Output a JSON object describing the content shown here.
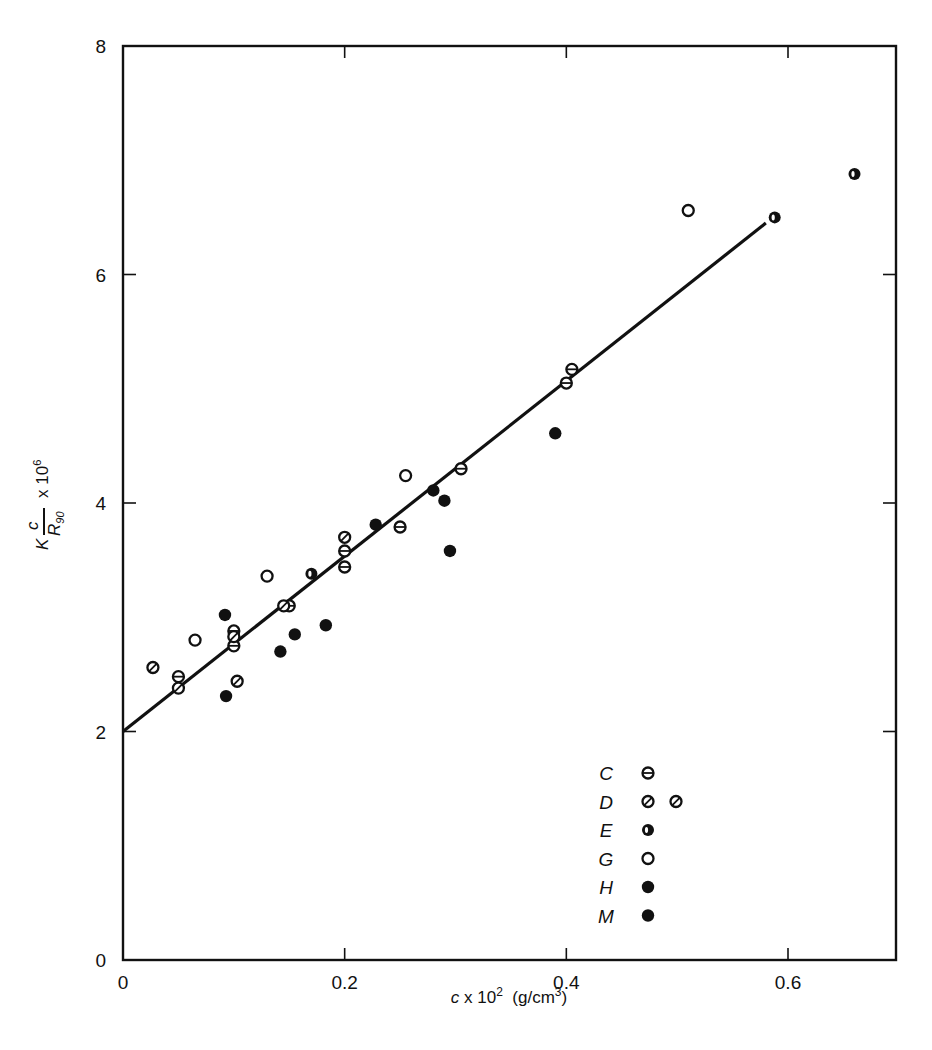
{
  "chart_data": {
    "type": "scatter",
    "title": "",
    "xlabel": "c x 10^2 (g/cm^3)",
    "ylabel": "K c/R90 x 10^6",
    "xlim": [
      0,
      0.7
    ],
    "ylim": [
      0,
      8
    ],
    "grid": false,
    "legend_position": "lower right (inside)",
    "x_ticks": [
      "0",
      "0.2",
      "0.4",
      "0.6"
    ],
    "y_ticks": [
      "0",
      "2",
      "4",
      "6",
      "8"
    ],
    "fit_line": {
      "x": [
        0,
        0.58
      ],
      "y": [
        2.0,
        6.45
      ],
      "label": "linear fit"
    },
    "series": [
      {
        "name": "C",
        "marker": "circle-horizontal-bar",
        "points": [
          [
            0.05,
            2.48
          ],
          [
            0.1,
            2.88
          ],
          [
            0.1,
            2.75
          ],
          [
            0.15,
            3.1
          ],
          [
            0.2,
            3.58
          ],
          [
            0.2,
            3.44
          ],
          [
            0.25,
            3.79
          ],
          [
            0.305,
            4.3
          ],
          [
            0.405,
            5.17
          ],
          [
            0.4,
            5.05
          ]
        ]
      },
      {
        "name": "D",
        "marker": "circle-diagonal-bar",
        "points": [
          [
            0.027,
            2.56
          ],
          [
            0.05,
            2.38
          ],
          [
            0.1,
            2.83
          ],
          [
            0.103,
            2.44
          ],
          [
            0.145,
            3.1
          ],
          [
            0.2,
            3.7
          ]
        ]
      },
      {
        "name": "E",
        "marker": "circle-half-filled",
        "points": [
          [
            0.17,
            3.38
          ],
          [
            0.588,
            6.5
          ],
          [
            0.66,
            6.88
          ]
        ]
      },
      {
        "name": "G",
        "marker": "circle-open",
        "points": [
          [
            0.065,
            2.8
          ],
          [
            0.13,
            3.36
          ],
          [
            0.255,
            4.24
          ],
          [
            0.51,
            6.56
          ]
        ]
      },
      {
        "name": "H",
        "marker": "circle-filled",
        "points": [
          [
            0.092,
            3.02
          ],
          [
            0.142,
            2.7
          ],
          [
            0.155,
            2.85
          ],
          [
            0.183,
            2.93
          ],
          [
            0.228,
            3.81
          ],
          [
            0.28,
            4.11
          ],
          [
            0.29,
            4.02
          ]
        ]
      },
      {
        "name": "M",
        "marker": "circle-filled",
        "points": [
          [
            0.093,
            2.31
          ],
          [
            0.295,
            3.58
          ],
          [
            0.39,
            4.61
          ]
        ]
      }
    ]
  },
  "axes": {
    "x_label_prefix": "c",
    "x_label_mid": " x 10",
    "x_label_exp": "2",
    "x_label_unit": "  (g/cm",
    "x_label_unit_exp": "3",
    "x_label_close": ")",
    "y_label_k": "K",
    "y_label_num": "c",
    "y_label_den": "R",
    "y_label_den_sub": "90",
    "y_label_times": "x 10",
    "y_label_exp": "6"
  },
  "legend": {
    "items": [
      {
        "label": "C",
        "marker": "circle-horizontal-bar"
      },
      {
        "label": "D",
        "marker": "circle-diagonal-bar",
        "extra": true
      },
      {
        "label": "E",
        "marker": "circle-half-filled"
      },
      {
        "label": "G",
        "marker": "circle-open"
      },
      {
        "label": "H",
        "marker": "circle-filled"
      },
      {
        "label": "M",
        "marker": "circle-filled"
      }
    ]
  },
  "colors": {
    "ink": "#111111",
    "background": "#ffffff"
  }
}
